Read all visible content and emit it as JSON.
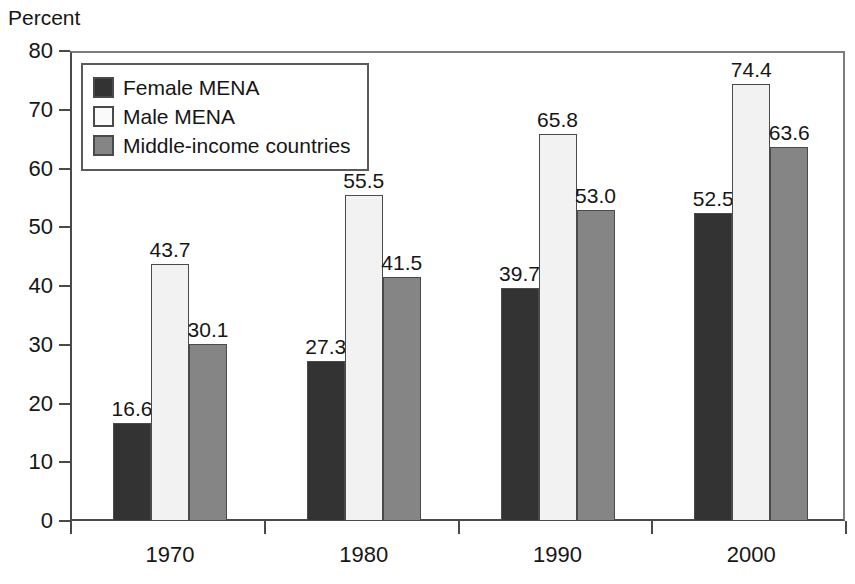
{
  "chart_data": {
    "type": "bar",
    "title": "",
    "ylabel": "Percent",
    "xlabel": "",
    "ylim": [
      0,
      80
    ],
    "ytick_values": [
      0,
      10,
      20,
      30,
      40,
      50,
      60,
      70,
      80
    ],
    "ytick_labels": [
      "0",
      "10",
      "20",
      "30",
      "40",
      "50",
      "60",
      "70",
      "80"
    ],
    "categories": [
      "1970",
      "1980",
      "1990",
      "2000"
    ],
    "grid": false,
    "legend_position": "upper-left-inside",
    "series": [
      {
        "name": "Female MENA",
        "color": "#333333",
        "values": [
          16.6,
          27.3,
          39.7,
          52.5
        ],
        "labels": [
          "16.6",
          "27.3",
          "39.7",
          "52.5"
        ]
      },
      {
        "name": "Male MENA",
        "color": "#f2f2f2",
        "values": [
          43.7,
          55.5,
          65.8,
          74.4
        ],
        "labels": [
          "43.7",
          "55.5",
          "65.8",
          "74.4"
        ]
      },
      {
        "name": "Middle-income countries",
        "color": "#858585",
        "values": [
          30.1,
          41.5,
          53.0,
          63.6
        ],
        "labels": [
          "30.1",
          "41.5",
          "53.0",
          "63.6"
        ]
      }
    ]
  },
  "legend": {
    "items": [
      {
        "label": "Female MENA",
        "swatch": "dark-gray-swatch"
      },
      {
        "label": "Male MENA",
        "swatch": "white-swatch"
      },
      {
        "label": "Middle-income countries",
        "swatch": "medium-gray-swatch"
      }
    ]
  },
  "colors": {
    "female_mena": "#333333",
    "male_mena": "#f2f2f2",
    "middle_income": "#858585",
    "axis": "#4a4a4a",
    "text": "#161616",
    "background": "#ffffff"
  }
}
